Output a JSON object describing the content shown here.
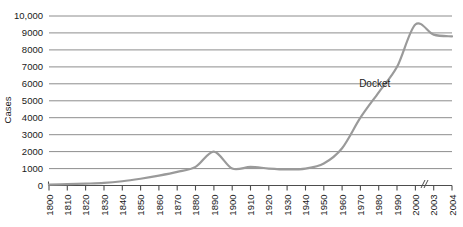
{
  "chart_data": {
    "type": "line",
    "title": "",
    "xlabel": "",
    "ylabel": "Cases",
    "ylim": [
      0,
      10000
    ],
    "ytick_labels": [
      "0",
      "1000",
      "2000",
      "3000",
      "4000",
      "5000",
      "6000",
      "7000",
      "8000",
      "9000",
      "10,000"
    ],
    "ytick_values": [
      0,
      1000,
      2000,
      3000,
      4000,
      5000,
      6000,
      7000,
      8000,
      9000,
      10000
    ],
    "grid": true,
    "legend": "none",
    "axis_break": {
      "symbol": "//",
      "between": [
        "2000",
        "2003"
      ]
    },
    "categories": [
      "1800",
      "1810",
      "1820",
      "1830",
      "1840",
      "1850",
      "1860",
      "1870",
      "1880",
      "1890",
      "1900",
      "1910",
      "1920",
      "1930",
      "1940",
      "1950",
      "1960",
      "1970",
      "1980",
      "1990",
      "2000",
      "2003",
      "2004"
    ],
    "series": [
      {
        "name": "Docket",
        "values": [
          50,
          80,
          110,
          150,
          250,
          400,
          580,
          800,
          1100,
          2000,
          1000,
          1100,
          1000,
          950,
          1000,
          1300,
          2200,
          4000,
          5500,
          7000,
          9500,
          8900,
          8800
        ]
      }
    ],
    "annotations": [
      {
        "text": "Docket",
        "x_category": "1980",
        "y_value": 6000
      }
    ],
    "colors": {
      "line": "#9a9a9a",
      "grid": "#808080",
      "axis": "#4d4d4d",
      "text": "#1a1a1a",
      "background": "#ffffff"
    }
  },
  "axis": {
    "y_title": "Cases"
  }
}
